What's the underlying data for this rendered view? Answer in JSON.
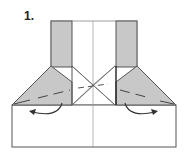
{
  "diagram": {
    "step_label": "1.",
    "colors": {
      "paper_white": "#ffffff",
      "paper_colored": "#c8c8c8",
      "outline": "#555555",
      "crease": "#888888",
      "arrow": "#333333"
    },
    "elements": [
      "bottom-base-rectangle",
      "left-vertical-flap",
      "right-vertical-flap",
      "left-shoulder-triangle",
      "right-shoulder-triangle",
      "center-crease-line",
      "x-crease-lines",
      "left-rotate-arrow",
      "right-rotate-arrow"
    ]
  }
}
